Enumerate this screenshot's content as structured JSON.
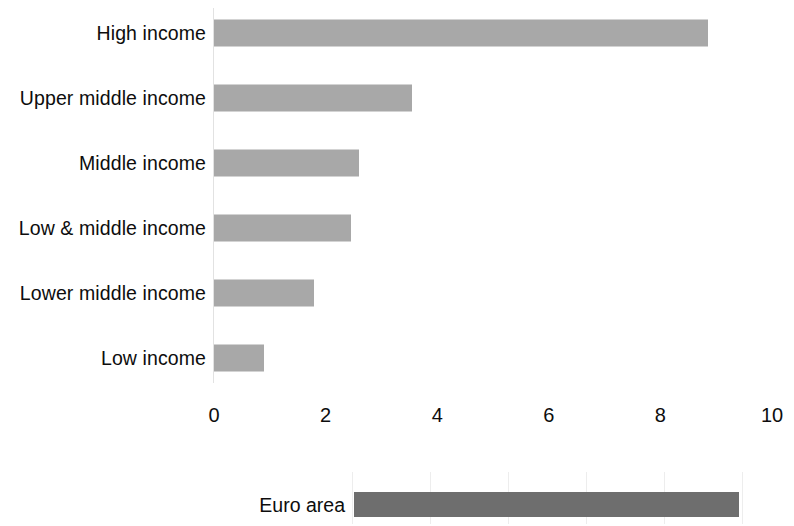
{
  "chart_data": {
    "type": "bar",
    "orientation": "horizontal",
    "title": "",
    "subtitle": "",
    "xlabel": "",
    "ylabel": "",
    "xlim": [
      0,
      10
    ],
    "ylim": null,
    "grid": false,
    "legend": null,
    "tick_labels": [
      "0",
      "2",
      "4",
      "6",
      "8",
      "10"
    ],
    "tick_values": [
      0,
      2,
      4,
      6,
      8,
      10
    ],
    "categories": [
      "High income",
      "Upper middle income",
      "Middle income",
      "Low & middle income",
      "Lower middle income",
      "Low income"
    ],
    "values": [
      8.85,
      3.55,
      2.6,
      2.45,
      1.8,
      0.9
    ],
    "bar_color": "#a8a8a8",
    "secondary_panel": {
      "categories": [
        "Euro area"
      ],
      "values": [
        9.4
      ],
      "value_start": 2.5,
      "bar_color": "#6e6e6e",
      "grid": true,
      "xlim": [
        0,
        10
      ]
    },
    "annotations": []
  },
  "bars": [
    {
      "label": "High income",
      "value": 8.85
    },
    {
      "label": "Upper middle income",
      "value": 3.55
    },
    {
      "label": "Middle income",
      "value": 2.6
    },
    {
      "label": "Low & middle income",
      "value": 2.45
    },
    {
      "label": "Lower middle income",
      "value": 1.8
    },
    {
      "label": "Low income",
      "value": 0.9
    }
  ],
  "axis": {
    "ticks": [
      "0",
      "2",
      "4",
      "6",
      "8",
      "10"
    ]
  },
  "euro": {
    "label": "Euro area",
    "value": 9.4,
    "start": 2.5
  },
  "colors": {
    "bar": "#a8a8a8",
    "euro_bar": "#6e6e6e",
    "background": "#ffffff",
    "text": "#0d0d0d",
    "axis": "#e2e2e2"
  }
}
